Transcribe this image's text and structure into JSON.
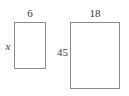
{
  "figure": {
    "type": "geometry-diagram",
    "stroke_color": "#8a8a8a",
    "text_color": "#3a3a3a",
    "background_color": "#ffffff",
    "shapes": [
      {
        "name": "small-rectangle",
        "top_label": "6",
        "left_label": "x",
        "left_label_style": "italic"
      },
      {
        "name": "large-rectangle",
        "top_label": "18",
        "left_label": "45",
        "left_label_style": "normal"
      }
    ]
  }
}
